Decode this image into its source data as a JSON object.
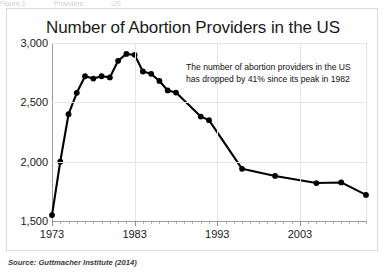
{
  "figure": {
    "top_cropped_text": [
      "Figure 1",
      "Providers",
      "US"
    ],
    "source_note": "Source: Guttmacher Institute (2014)"
  },
  "annotation": {
    "line1": "The number of abortion providers in the US",
    "line2": "has dropped by 41% since its peak in 1982"
  },
  "chart_data": {
    "type": "line",
    "title": "Number of Abortion Providers in the US",
    "xlabel": "",
    "ylabel": "",
    "xlim": [
      1973,
      2011
    ],
    "ylim": [
      1500,
      3000
    ],
    "ytick_labels": [
      "3,000",
      "2,500",
      "2,000",
      "1,500"
    ],
    "yticks": [
      3000,
      2500,
      2000,
      1500
    ],
    "xtick_labels": [
      "1973",
      "1983",
      "1993",
      "2003"
    ],
    "xticks": [
      1973,
      1983,
      1993,
      2003
    ],
    "minor_xtick_interval": 1,
    "grid": "both",
    "legend": "none",
    "marker": "filled-circle",
    "line_color": "#000000",
    "series": [
      {
        "name": "Abortion providers in the US",
        "x": [
          1973,
          1974,
          1975,
          1976,
          1977,
          1978,
          1979,
          1980,
          1981,
          1982,
          1983,
          1984,
          1985,
          1986,
          1987,
          1988,
          1991,
          1992,
          1996,
          2000,
          2005,
          2008,
          2011
        ],
        "values": [
          1550,
          2000,
          2400,
          2580,
          2720,
          2700,
          2720,
          2710,
          2850,
          2908,
          2900,
          2760,
          2740,
          2680,
          2600,
          2582,
          2380,
          2350,
          1940,
          1880,
          1820,
          1825,
          1720
        ]
      }
    ],
    "annotations": [
      {
        "text": "The number of abortion providers in the US has dropped by 41% since its peak in 1982",
        "x": 1993,
        "y": 2780
      }
    ]
  }
}
